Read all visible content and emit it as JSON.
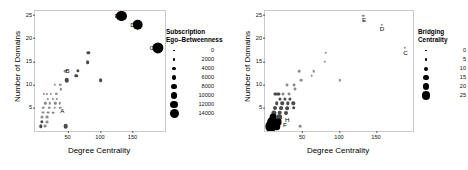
{
  "figure": {
    "panels": [
      {
        "id": "left",
        "axes": {
          "xlabel": "Degree Centrality",
          "ylabel": "Number of Domains",
          "xticks": [
            "50",
            "100",
            "150"
          ],
          "yticks": [
            "5",
            "10",
            "15",
            "20",
            "25"
          ],
          "xlim": [
            0,
            200
          ],
          "ylim": [
            0,
            26
          ]
        },
        "legend": {
          "title_line1": "Subscription",
          "title_line2": "Ego–Betweenness",
          "values": [
            "0",
            "2000",
            "4000",
            "6000",
            "8000",
            "10000",
            "12000",
            "14000"
          ],
          "sizes": [
            1.5,
            2.4,
            3.4,
            4.5,
            5.6,
            6.8,
            7.9,
            9.0
          ]
        },
        "labels": [
          {
            "text": "A",
            "x": 42,
            "y": 4.4
          },
          {
            "text": "B",
            "x": 50,
            "y": 13.0
          },
          {
            "text": "C",
            "x": 180,
            "y": 18.0
          },
          {
            "text": "D",
            "x": 150,
            "y": 23.0
          },
          {
            "text": "E",
            "x": 126,
            "y": 25.0
          }
        ]
      },
      {
        "id": "right",
        "axes": {
          "xlabel": "Degree Centrality",
          "ylabel": "Number of Domains",
          "xticks": [
            "50",
            "100",
            "150"
          ],
          "yticks": [
            "5",
            "10",
            "15",
            "20",
            "25"
          ],
          "xlim": [
            0,
            200
          ],
          "ylim": [
            0,
            26
          ]
        },
        "legend": {
          "title_line1": "Bridging",
          "title_line2": "Centrality",
          "values": [
            "0",
            "5",
            "10",
            "15",
            "20",
            "25"
          ],
          "sizes": [
            1.5,
            2.6,
            4.0,
            5.4,
            6.8,
            8.2
          ]
        },
        "labels": [
          {
            "text": "C",
            "x": 190,
            "y": 17.0
          },
          {
            "text": "D",
            "x": 158,
            "y": 22.0
          },
          {
            "text": "E",
            "x": 134,
            "y": 24.0
          },
          {
            "text": "H",
            "x": 30,
            "y": 2.4
          },
          {
            "text": "F",
            "x": 27,
            "y": 1.3
          }
        ]
      }
    ]
  },
  "chart_data": [
    {
      "type": "scatter",
      "title": "",
      "xlabel": "Degree Centrality",
      "ylabel": "Number of Domains",
      "xlim": [
        0,
        200
      ],
      "ylim": [
        0,
        26
      ],
      "grid": false,
      "legend_position": "right",
      "size_legend": {
        "title": "Subscription Ego–Betweenness",
        "values": [
          0,
          2000,
          4000,
          6000,
          8000,
          10000,
          12000,
          14000
        ]
      },
      "points": [
        {
          "x": 133,
          "y": 25,
          "size": 11000,
          "label": "E"
        },
        {
          "x": 158,
          "y": 23,
          "size": 12500,
          "label": "D"
        },
        {
          "x": 189,
          "y": 18,
          "size": 14000,
          "label": "C"
        },
        {
          "x": 46,
          "y": 13,
          "size": 300,
          "label": "B"
        },
        {
          "x": 49,
          "y": 11,
          "size": 1500,
          "label": ""
        },
        {
          "x": 82,
          "y": 17,
          "size": 600,
          "label": ""
        },
        {
          "x": 81,
          "y": 15,
          "size": 900,
          "label": ""
        },
        {
          "x": 66,
          "y": 13,
          "size": 600,
          "label": ""
        },
        {
          "x": 63,
          "y": 12,
          "size": 800,
          "label": ""
        },
        {
          "x": 101,
          "y": 11,
          "size": 900,
          "label": ""
        },
        {
          "x": 47,
          "y": 1,
          "size": 1700,
          "label": "A"
        },
        {
          "x": 30,
          "y": 10,
          "size": 200,
          "label": ""
        },
        {
          "x": 39,
          "y": 10,
          "size": 200,
          "label": ""
        },
        {
          "x": 40,
          "y": 9,
          "size": 200,
          "label": ""
        },
        {
          "x": 33,
          "y": 8,
          "size": 200,
          "label": ""
        },
        {
          "x": 24,
          "y": 8,
          "size": 150,
          "label": ""
        },
        {
          "x": 18,
          "y": 8,
          "size": 150,
          "label": ""
        },
        {
          "x": 14,
          "y": 8,
          "size": 150,
          "label": ""
        },
        {
          "x": 20,
          "y": 7,
          "size": 150,
          "label": ""
        },
        {
          "x": 27,
          "y": 7,
          "size": 150,
          "label": ""
        },
        {
          "x": 34,
          "y": 7,
          "size": 150,
          "label": ""
        },
        {
          "x": 16,
          "y": 6,
          "size": 200,
          "label": ""
        },
        {
          "x": 23,
          "y": 6,
          "size": 200,
          "label": ""
        },
        {
          "x": 31,
          "y": 6,
          "size": 200,
          "label": ""
        },
        {
          "x": 38,
          "y": 6,
          "size": 200,
          "label": ""
        },
        {
          "x": 13,
          "y": 5,
          "size": 250,
          "label": ""
        },
        {
          "x": 22,
          "y": 5,
          "size": 250,
          "label": ""
        },
        {
          "x": 30,
          "y": 5,
          "size": 250,
          "label": ""
        },
        {
          "x": 39,
          "y": 5,
          "size": 250,
          "label": ""
        },
        {
          "x": 12,
          "y": 4,
          "size": 400,
          "label": ""
        },
        {
          "x": 20,
          "y": 4,
          "size": 400,
          "label": ""
        },
        {
          "x": 28,
          "y": 4,
          "size": 300,
          "label": ""
        },
        {
          "x": 11,
          "y": 3,
          "size": 500,
          "label": ""
        },
        {
          "x": 19,
          "y": 3,
          "size": 400,
          "label": ""
        },
        {
          "x": 10,
          "y": 2,
          "size": 600,
          "label": ""
        },
        {
          "x": 18,
          "y": 2,
          "size": 400,
          "label": ""
        },
        {
          "x": 9,
          "y": 1,
          "size": 700,
          "label": ""
        },
        {
          "x": 16,
          "y": 1,
          "size": 400,
          "label": ""
        }
      ]
    },
    {
      "type": "scatter",
      "title": "",
      "xlabel": "Degree Centrality",
      "ylabel": "Number of Domains",
      "xlim": [
        0,
        200
      ],
      "ylim": [
        0,
        26
      ],
      "grid": false,
      "legend_position": "right",
      "size_legend": {
        "title": "Bridging Centrality",
        "values": [
          0,
          5,
          10,
          15,
          20,
          25
        ]
      },
      "points": [
        {
          "x": 133,
          "y": 25,
          "size": 0.4,
          "label": "E"
        },
        {
          "x": 158,
          "y": 23,
          "size": 0.4,
          "label": "D"
        },
        {
          "x": 189,
          "y": 18,
          "size": 0.4,
          "label": "C"
        },
        {
          "x": 46,
          "y": 13,
          "size": 0.6,
          "label": ""
        },
        {
          "x": 49,
          "y": 11,
          "size": 0.6,
          "label": ""
        },
        {
          "x": 82,
          "y": 17,
          "size": 0.4,
          "label": ""
        },
        {
          "x": 81,
          "y": 15,
          "size": 0.4,
          "label": ""
        },
        {
          "x": 66,
          "y": 13,
          "size": 0.5,
          "label": ""
        },
        {
          "x": 63,
          "y": 12,
          "size": 0.5,
          "label": ""
        },
        {
          "x": 101,
          "y": 11,
          "size": 0.4,
          "label": ""
        },
        {
          "x": 47,
          "y": 1,
          "size": 0.6,
          "label": ""
        },
        {
          "x": 30,
          "y": 10,
          "size": 0.8,
          "label": ""
        },
        {
          "x": 39,
          "y": 10,
          "size": 0.8,
          "label": ""
        },
        {
          "x": 40,
          "y": 9,
          "size": 0.8,
          "label": ""
        },
        {
          "x": 33,
          "y": 8,
          "size": 0.8,
          "label": ""
        },
        {
          "x": 24,
          "y": 8,
          "size": 0.8,
          "label": ""
        },
        {
          "x": 18,
          "y": 8,
          "size": 1.0,
          "label": ""
        },
        {
          "x": 14,
          "y": 8,
          "size": 1.0,
          "label": ""
        },
        {
          "x": 20,
          "y": 7,
          "size": 1.0,
          "label": ""
        },
        {
          "x": 27,
          "y": 7,
          "size": 1.0,
          "label": ""
        },
        {
          "x": 34,
          "y": 7,
          "size": 1.0,
          "label": ""
        },
        {
          "x": 16,
          "y": 6,
          "size": 1.4,
          "label": ""
        },
        {
          "x": 23,
          "y": 6,
          "size": 1.4,
          "label": ""
        },
        {
          "x": 31,
          "y": 6,
          "size": 1.2,
          "label": ""
        },
        {
          "x": 38,
          "y": 6,
          "size": 1.2,
          "label": ""
        },
        {
          "x": 13,
          "y": 5,
          "size": 2.0,
          "label": ""
        },
        {
          "x": 22,
          "y": 5,
          "size": 1.8,
          "label": ""
        },
        {
          "x": 30,
          "y": 5,
          "size": 1.6,
          "label": ""
        },
        {
          "x": 39,
          "y": 5,
          "size": 1.4,
          "label": ""
        },
        {
          "x": 12,
          "y": 4,
          "size": 4.0,
          "label": ""
        },
        {
          "x": 20,
          "y": 4,
          "size": 3.0,
          "label": ""
        },
        {
          "x": 28,
          "y": 4,
          "size": 2.0,
          "label": ""
        },
        {
          "x": 11,
          "y": 3,
          "size": 8.0,
          "label": ""
        },
        {
          "x": 19,
          "y": 3,
          "size": 5.0,
          "label": ""
        },
        {
          "x": 9,
          "y": 2,
          "size": 18.0,
          "label": "H"
        },
        {
          "x": 18,
          "y": 2,
          "size": 8.0,
          "label": ""
        },
        {
          "x": 8,
          "y": 1,
          "size": 25.0,
          "label": "F"
        },
        {
          "x": 16,
          "y": 1,
          "size": 10.0,
          "label": ""
        }
      ]
    }
  ]
}
